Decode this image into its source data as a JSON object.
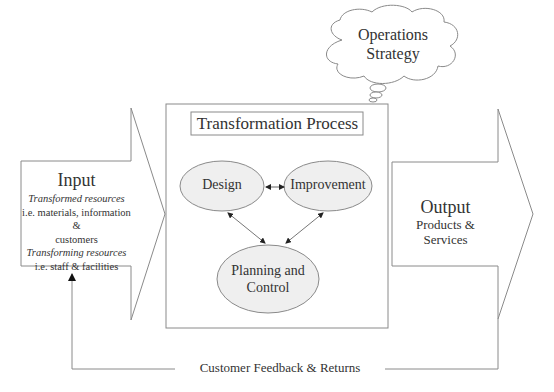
{
  "input": {
    "title": "Input",
    "lines": [
      {
        "text": "Transformed resources",
        "style": "italic"
      },
      {
        "text": "i.e. materials, information &",
        "style": "normal"
      },
      {
        "text": "customers",
        "style": "normal"
      },
      {
        "text": "Transforming resources",
        "style": "italic"
      },
      {
        "text": "i.e. staff & facilities",
        "style": "normal"
      }
    ]
  },
  "process": {
    "title": "Transformation Process",
    "nodes": [
      {
        "id": "design",
        "label": "Design"
      },
      {
        "id": "improvement",
        "label": "Improvement"
      },
      {
        "id": "planning",
        "label_line1": "Planning and",
        "label_line2": "Control"
      }
    ],
    "edges": [
      {
        "from": "design",
        "to": "improvement",
        "type": "bidirectional"
      },
      {
        "from": "design",
        "to": "planning",
        "type": "bidirectional"
      },
      {
        "from": "improvement",
        "to": "planning",
        "type": "bidirectional"
      }
    ]
  },
  "output": {
    "title": "Output",
    "subtitle": "Products & Services"
  },
  "strategy": {
    "line1": "Operations",
    "line2": "Strategy"
  },
  "feedback": {
    "label": "Customer Feedback & Returns"
  },
  "colors": {
    "stroke": "#8a8a8a",
    "node_fill": "#efefef",
    "text": "#333333"
  }
}
